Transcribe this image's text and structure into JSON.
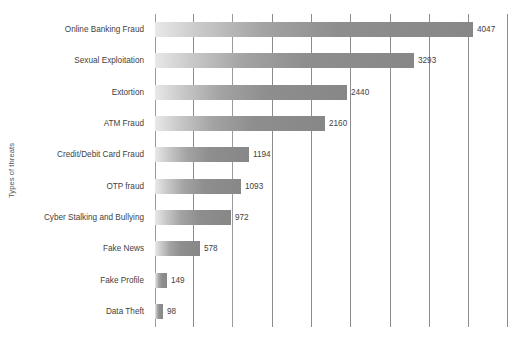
{
  "chart_data": {
    "type": "bar",
    "orientation": "horizontal",
    "title": "",
    "xlabel": "",
    "ylabel": "Types of threats",
    "grid": true,
    "legend": false,
    "xlim": [
      0,
      4500
    ],
    "gridline_count": 10,
    "categories": [
      "Online Banking Fraud",
      "Sexual Exploitation",
      "Extortion",
      "ATM Fraud",
      "Credit/Debit Card Fraud",
      "OTP fraud",
      "Cyber Stalking and Bullying",
      "Fake News",
      "Fake Profile",
      "Data Theft"
    ],
    "values": [
      4047,
      3293,
      2440,
      2160,
      1194,
      1093,
      972,
      578,
      149,
      98
    ],
    "value_labels": [
      "4047",
      "3293",
      "2440",
      "2160",
      "1194",
      "1093",
      "972",
      "578",
      "149",
      "98"
    ],
    "bar_color": "#878787",
    "bar_gradient_from": "#e8e8e8",
    "gridline_color": "#8c8c8c",
    "background": "#ffffff"
  }
}
